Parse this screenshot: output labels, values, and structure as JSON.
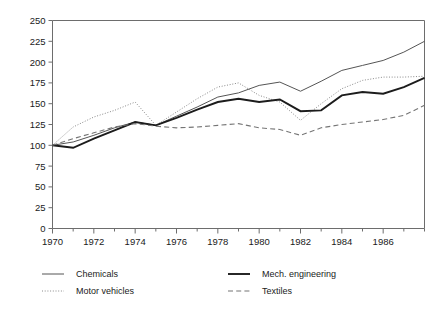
{
  "chart_data": {
    "type": "line",
    "title": "",
    "subtitle": "",
    "xlabel": "",
    "ylabel": "",
    "xlim": [
      1970,
      1988
    ],
    "ylim": [
      0,
      250
    ],
    "grid": false,
    "legend_position": "bottom",
    "x": [
      1970,
      1971,
      1972,
      1973,
      1974,
      1975,
      1976,
      1977,
      1978,
      1979,
      1980,
      1981,
      1982,
      1983,
      1984,
      1985,
      1986,
      1987,
      1988
    ],
    "x_tick_labels": [
      "1970",
      "1972",
      "1974",
      "1976",
      "1978",
      "1980",
      "1982",
      "1984",
      "1986"
    ],
    "x_tick_values": [
      1970,
      1972,
      1974,
      1976,
      1978,
      1980,
      1982,
      1984,
      1986
    ],
    "y_tick_labels": [
      "0",
      "25",
      "50",
      "75",
      "100",
      "125",
      "150",
      "175",
      "200",
      "225",
      "250"
    ],
    "y_tick_values": [
      0,
      25,
      50,
      75,
      100,
      125,
      150,
      175,
      200,
      225,
      250
    ],
    "series": [
      {
        "name": "Chemicals",
        "style": "thin-solid",
        "color": "#555555",
        "values": [
          100,
          104,
          112,
          121,
          128,
          124,
          135,
          146,
          158,
          163,
          172,
          176,
          165,
          177,
          190,
          196,
          202,
          212,
          225
        ]
      },
      {
        "name": "Motor vehicles",
        "style": "dotted",
        "color": "#8a8a8a",
        "values": [
          100,
          122,
          134,
          142,
          152,
          124,
          140,
          156,
          170,
          175,
          160,
          152,
          130,
          150,
          168,
          178,
          182,
          182,
          183
        ]
      },
      {
        "name": "Mech. engineering",
        "style": "thick-solid",
        "color": "#1c1c1c",
        "values": [
          100,
          97,
          108,
          118,
          128,
          124,
          133,
          143,
          152,
          156,
          152,
          155,
          141,
          142,
          160,
          164,
          162,
          170,
          181
        ]
      },
      {
        "name": "Textiles",
        "style": "dashed",
        "color": "#757575",
        "values": [
          100,
          108,
          115,
          122,
          126,
          123,
          121,
          122,
          124,
          126,
          121,
          119,
          112,
          121,
          125,
          128,
          131,
          136,
          148
        ]
      }
    ]
  },
  "legend": {
    "entries": [
      {
        "label": "Chemicals",
        "marker": "thin-solid-line-icon"
      },
      {
        "label": "Mech. engineering",
        "marker": "thick-solid-line-icon"
      },
      {
        "label": "Motor vehicles",
        "marker": "dotted-line-icon"
      },
      {
        "label": "Textiles",
        "marker": "dashed-line-icon"
      }
    ]
  }
}
